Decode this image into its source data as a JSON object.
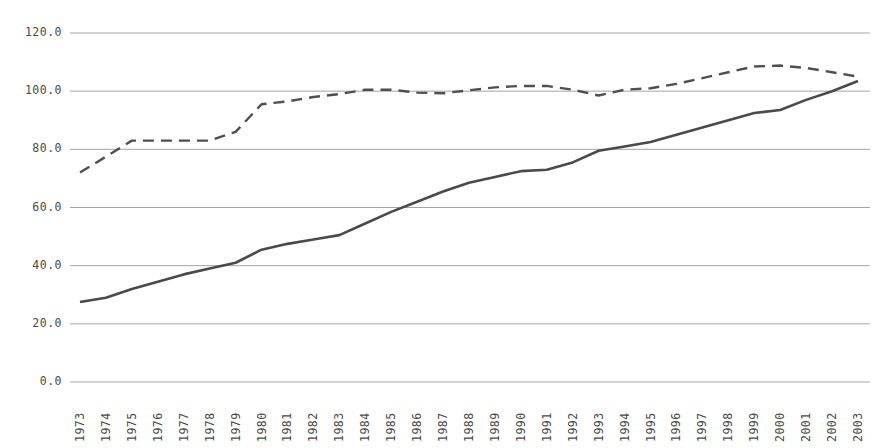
{
  "chart_data": {
    "type": "line",
    "title": "",
    "subtitle": "",
    "xlabel": "",
    "ylabel": "",
    "ylim": [
      0.0,
      120.0
    ],
    "yticks": [
      "0.0",
      "20.0",
      "40.0",
      "60.0",
      "80.0",
      "100.0",
      "120.0"
    ],
    "ytick_values": [
      0.0,
      20.0,
      40.0,
      60.0,
      80.0,
      100.0,
      120.0
    ],
    "grid": "horizontal",
    "legend": "none",
    "legend_entries": [],
    "annotations": [],
    "categories": [
      "1973",
      "1974",
      "1975",
      "1976",
      "1977",
      "1978",
      "1979",
      "1980",
      "1981",
      "1982",
      "1983",
      "1984",
      "1985",
      "1986",
      "1987",
      "1988",
      "1989",
      "1990",
      "1991",
      "1992",
      "1993",
      "1994",
      "1995",
      "1996",
      "1997",
      "1998",
      "1999",
      "2000",
      "2001",
      "2002",
      "2003"
    ],
    "series": [
      {
        "name": "series-dashed",
        "style": "dashed",
        "color": "#4f4f4f",
        "values": [
          72.0,
          77.5,
          83.0,
          83.0,
          83.0,
          83.0,
          86.0,
          95.5,
          96.5,
          98.0,
          99.0,
          100.5,
          100.5,
          99.5,
          99.3,
          100.3,
          101.3,
          101.8,
          101.8,
          100.5,
          98.5,
          100.5,
          101.0,
          102.5,
          104.5,
          106.5,
          108.5,
          108.8,
          108.0,
          106.5,
          105.0
        ]
      },
      {
        "name": "series-solid",
        "style": "solid",
        "color": "#4a4a4a",
        "values": [
          27.5,
          29.0,
          32.0,
          34.5,
          37.0,
          39.0,
          41.0,
          45.5,
          47.5,
          49.0,
          50.5,
          54.5,
          58.5,
          62.0,
          65.5,
          68.5,
          70.5,
          72.5,
          73.0,
          75.5,
          79.5,
          81.0,
          82.5,
          85.0,
          87.5,
          90.0,
          92.5,
          93.5,
          97.0,
          100.0,
          103.5
        ]
      }
    ]
  }
}
